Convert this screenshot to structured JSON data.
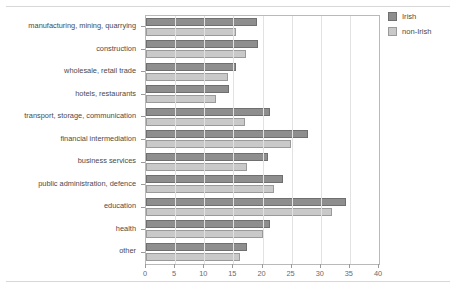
{
  "chart_data": {
    "type": "bar",
    "orientation": "horizontal",
    "title": "",
    "subtitle": "",
    "xlabel": "",
    "ylabel": "",
    "xlim": [
      0,
      40
    ],
    "xticks": [
      0,
      5,
      10,
      15,
      20,
      25,
      30,
      35,
      40
    ],
    "xtick_labels": [
      "0",
      "5",
      "10",
      "15",
      "20",
      "25",
      "30",
      "35",
      "40"
    ],
    "grid": true,
    "grid_axis": "x",
    "legend_position": "top-right",
    "categories": [
      "manufacturing, mining, quarrying",
      "construction",
      "wholesale, retail trade",
      "hotels, restaurants",
      "transport, storage, communication",
      "financial intermediation",
      "business services",
      "public administration, defence",
      "education",
      "health",
      "other"
    ],
    "series": [
      {
        "name": "Irish",
        "color": "#8e8e8e",
        "values": [
          19.1,
          19.2,
          15.5,
          14.3,
          21.3,
          27.8,
          20.9,
          23.5,
          34.3,
          21.3,
          17.3
        ]
      },
      {
        "name": "non-Irish",
        "color": "#c9c9c9",
        "values": [
          15.5,
          17.2,
          14.1,
          12.0,
          17.0,
          24.9,
          17.3,
          22.0,
          31.9,
          20.1,
          16.2
        ]
      }
    ]
  },
  "legend": {
    "items": [
      {
        "label": "Irish",
        "color": "#8e8e8e"
      },
      {
        "label": "non-Irish",
        "color": "#c9c9c9"
      }
    ]
  },
  "colors": {
    "irish": "#8e8e8e",
    "non_irish": "#c9c9c9",
    "axis": "#b9b9b9",
    "grid": "#e2e2e2",
    "text": "#4a4a4a"
  }
}
